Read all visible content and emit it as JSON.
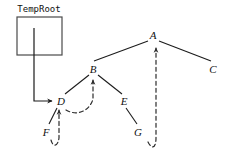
{
  "diagram": {
    "title_box": {
      "label": "TempRoot",
      "label_x": 39,
      "label_y": 9,
      "rect": {
        "x": 17,
        "y": 17,
        "width": 45,
        "height": 38
      }
    },
    "colors": {
      "stroke": "#1b1b1b",
      "dashed_stroke": "#3a3a3a",
      "box_stroke": "#4a4a4a",
      "background": "#ffffff"
    },
    "nodes": [
      {
        "id": "A",
        "label": "A",
        "x": 153,
        "y": 35
      },
      {
        "id": "B",
        "label": "B",
        "x": 93,
        "y": 69
      },
      {
        "id": "C",
        "label": "C",
        "x": 213,
        "y": 69
      },
      {
        "id": "D",
        "label": "D",
        "x": 61,
        "y": 101
      },
      {
        "id": "E",
        "label": "E",
        "x": 124,
        "y": 101
      },
      {
        "id": "F",
        "label": "F",
        "x": 46,
        "y": 132
      },
      {
        "id": "G",
        "label": "G",
        "x": 138,
        "y": 132
      }
    ],
    "solid_edges": [
      {
        "from": "A",
        "to": "B",
        "d": "M 148 41 L 94 61"
      },
      {
        "from": "A",
        "to": "C",
        "d": "M 159 41 L 211 61"
      },
      {
        "from": "B",
        "to": "D",
        "d": "M 89 75 L 65 94"
      },
      {
        "from": "B",
        "to": "E",
        "d": "M 98 75 L 122 94"
      },
      {
        "from": "E",
        "to": "G",
        "d": "M 126 108 L 137 124"
      },
      {
        "from": "D",
        "to": "F",
        "d": "M 57 108 L 49 124"
      }
    ],
    "pointer_edge": {
      "from": "TempRoot",
      "to": "D",
      "d": "M 34 28 L 34 101 L 52 101",
      "arrow": true
    },
    "dashed_edges": [
      {
        "from": "G",
        "to": "A",
        "d": "M 148 142 C 152 150 156 148 156 138 L 156 48",
        "arrow": true
      },
      {
        "from": "F",
        "to": "D",
        "d": "M 51 140 C 53 148 58 146 59 138 L 59 110",
        "arrow": true
      },
      {
        "from": "D",
        "to": "B",
        "d": "M 66 110 C 78 117 90 110 93 99 L 93 80",
        "arrow": true
      }
    ],
    "arrow_marker": {
      "width": 5,
      "height": 7
    }
  }
}
